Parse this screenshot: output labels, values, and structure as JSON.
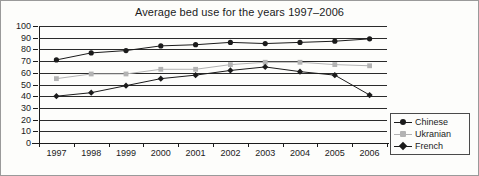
{
  "chart_data": {
    "type": "line",
    "title": "Average bed use for the years 1997–2006",
    "xlabel": "",
    "ylabel": "",
    "categories": [
      "1997",
      "1998",
      "1999",
      "2000",
      "2001",
      "2002",
      "2003",
      "2004",
      "2005",
      "2006"
    ],
    "ylim": [
      0,
      100
    ],
    "ytick_labels": [
      "100",
      "90",
      "80",
      "70",
      "60",
      "50",
      "40",
      "30",
      "20",
      "10",
      "0"
    ],
    "ytick_values": [
      100,
      90,
      80,
      70,
      60,
      50,
      40,
      30,
      20,
      10,
      0
    ],
    "grid": true,
    "legend_position": "right-bottom",
    "series": [
      {
        "name": "Chinese",
        "marker": "circle",
        "color": "#1b1b1b",
        "values": [
          71,
          77,
          79,
          83,
          84,
          86,
          85,
          86,
          87,
          89
        ]
      },
      {
        "name": "Ukranian",
        "marker": "square",
        "color": "#b3b3b3",
        "values": [
          55,
          59,
          59,
          63,
          63,
          67,
          69,
          69,
          67,
          66
        ]
      },
      {
        "name": "French",
        "marker": "diamond",
        "color": "#1b1b1b",
        "values": [
          40,
          43,
          49,
          55,
          58,
          62,
          65,
          61,
          58,
          41
        ]
      }
    ]
  },
  "legend": {
    "items": [
      {
        "label": "Chinese"
      },
      {
        "label": "Ukranian"
      },
      {
        "label": "French"
      }
    ]
  }
}
